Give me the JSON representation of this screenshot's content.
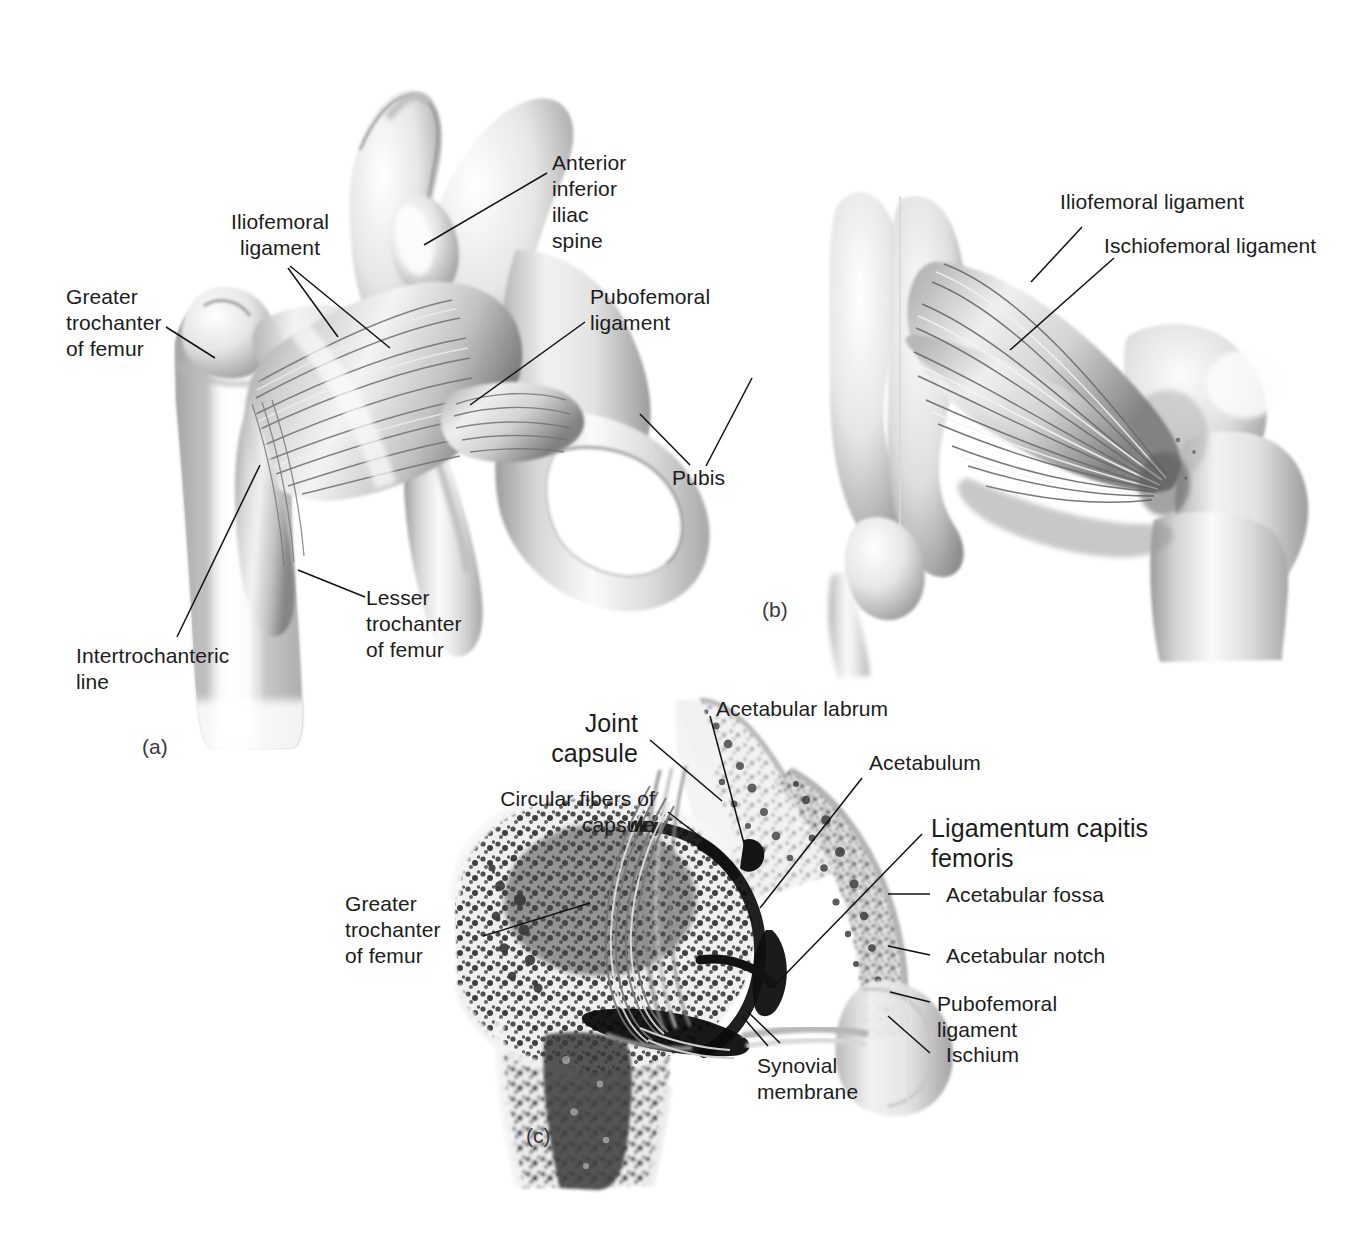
{
  "figure": {
    "background_color": "#ffffff",
    "ink_color": "#1c1c1c",
    "panels": [
      {
        "tag": "(a)",
        "view": "anterior view of right hip joint",
        "labels": [
          "Iliofemoral ligament",
          "Anterior inferior iliac spine",
          "Greater trochanter of femur",
          "Pubofemoral ligament",
          "Pubis",
          "Lesser trochanter of femur",
          "Intertrochanteric line"
        ]
      },
      {
        "tag": "(b)",
        "view": "posterior view of right hip joint",
        "labels": [
          "Iliofemoral ligament",
          "Ischiofemoral ligament"
        ]
      },
      {
        "tag": "(c)",
        "view": "coronal section of right hip joint",
        "labels": [
          "Joint capsule",
          "Circular fibers of capsule",
          "Greater trochanter of femur",
          "Acetabular labrum",
          "Acetabulum",
          "Ligamentum capitis femoris",
          "Acetabular fossa",
          "Acetabular notch",
          "Pubofemoral ligament",
          "Ischium",
          "Synovial membrane"
        ]
      }
    ]
  },
  "panel_a": {
    "tag": "(a)",
    "iliofemoral_ligament": "Iliofemoral\nligament",
    "anterior_inferior_iliac_spine": "Anterior\ninferior\niliac\nspine",
    "greater_trochanter_of_femur": "Greater\ntrochanter\nof femur",
    "pubofemoral_ligament": "Pubofemoral\nligament",
    "pubis": "Pubis",
    "lesser_trochanter_of_femur": "Lesser\ntrochanter\nof femur",
    "intertrochanteric_line": "Intertrochanteric\nline"
  },
  "panel_b": {
    "tag": "(b)",
    "iliofemoral_ligament": "Iliofemoral ligament",
    "ischiofemoral_ligament": "Ischiofemoral ligament"
  },
  "panel_c": {
    "tag": "(c)",
    "joint_capsule": "Joint\ncapsule",
    "circular_fibers_of_capsule": "Circular fibers of\ncapsule",
    "greater_trochanter_of_femur": "Greater\ntrochanter\nof femur",
    "acetabular_labrum": "Acetabular labrum",
    "acetabulum": "Acetabulum",
    "ligamentum_capitis_femoris": "Ligamentum capitis\nfemoris",
    "acetabular_fossa": "Acetabular fossa",
    "acetabular_notch": "Acetabular notch",
    "pubofemoral_ligament": "Pubofemoral\nligament",
    "ischium": "Ischium",
    "synovial_membrane": "Synovial\nmembrane"
  }
}
